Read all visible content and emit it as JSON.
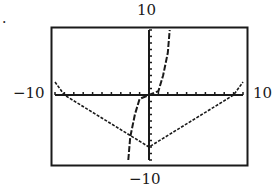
{
  "figure": {
    "bullet": ".",
    "window_labels": {
      "ymax": "10",
      "ymin": "−10",
      "xmin": "−10",
      "xmax": "10"
    }
  },
  "chart_data": {
    "type": "line",
    "title": "",
    "xlabel": "",
    "ylabel": "",
    "xlim": [
      -10,
      10
    ],
    "ylim": [
      -10,
      10
    ],
    "xscale_ticks": 1,
    "yscale_ticks": 1,
    "grid": false,
    "legend": null,
    "annotations": [
      "10",
      "−10",
      "−10",
      "10"
    ],
    "series": [
      {
        "name": "V-shaped graph (solid-dotted)",
        "style": "dotted",
        "x": [
          -10,
          -9,
          0,
          9,
          10
        ],
        "y": [
          2,
          0,
          -8,
          0,
          2
        ]
      },
      {
        "name": "steep increasing curve (dashed)",
        "style": "dashed",
        "x": [
          -2.2,
          -2,
          -1.5,
          -1,
          0,
          1,
          1.5,
          2,
          2.2
        ],
        "y": [
          -10,
          -6.5,
          -3,
          -0.6,
          0,
          0.6,
          3,
          6.5,
          10
        ]
      }
    ]
  }
}
